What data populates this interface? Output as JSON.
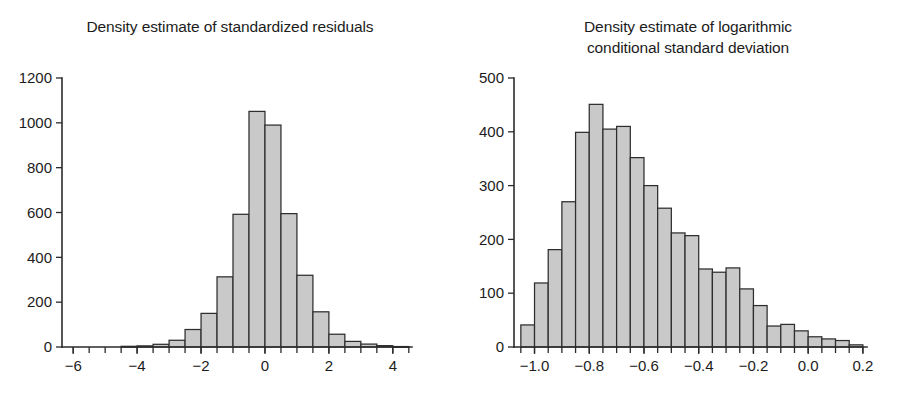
{
  "figure": {
    "background": "#ffffff",
    "bar_fill": "#c9c9c9",
    "bar_stroke": "#2e2e2e",
    "axis_color": "#2b2b2b",
    "panel_count": 2
  },
  "panels": {
    "left": {
      "title": "Density estimate of standardized residuals"
    },
    "right": {
      "title_line1": "Density estimate of logarithmic",
      "title_line2": "conditional standard deviation"
    }
  },
  "chart_data": [
    {
      "type": "bar",
      "id": "standardized-residuals-histogram",
      "title": "Density estimate of standardized residuals",
      "xlabel": "",
      "ylabel": "",
      "grid": false,
      "legend": false,
      "xlim": [
        -6.35,
        4.6
      ],
      "ylim": [
        0,
        1200
      ],
      "xticks": [
        -6,
        -4,
        -2,
        0,
        2,
        4
      ],
      "xtick_labels": [
        "−6",
        "−4",
        "−2",
        "0",
        "2",
        "4"
      ],
      "xminor_step": 0.5,
      "yticks": [
        0,
        200,
        400,
        600,
        800,
        1000,
        1200
      ],
      "ytick_labels": [
        "0",
        "200",
        "400",
        "600",
        "800",
        "1000",
        "1200"
      ],
      "bin_width": 0.5,
      "bin_edges": [
        -5.0,
        -4.5,
        -4.0,
        -3.5,
        -3.0,
        -2.5,
        -2.0,
        -1.5,
        -1.0,
        -0.5,
        0.0,
        0.5,
        1.0,
        1.5,
        2.0,
        2.5,
        3.0,
        3.5,
        4.0,
        4.5
      ],
      "bin_centers": [
        -4.75,
        -4.25,
        -3.75,
        -3.25,
        -2.75,
        -2.25,
        -1.75,
        -1.25,
        -0.75,
        -0.25,
        0.25,
        0.75,
        1.25,
        1.75,
        2.25,
        2.75,
        3.25,
        3.75,
        4.25
      ],
      "values": [
        0,
        3,
        5,
        12,
        30,
        78,
        150,
        313,
        592,
        1051,
        990,
        595,
        320,
        157,
        57,
        25,
        13,
        6,
        2
      ]
    },
    {
      "type": "bar",
      "id": "log-conditional-sd-histogram",
      "title": "Density estimate of logarithmic conditional standard deviation",
      "xlabel": "",
      "ylabel": "",
      "grid": false,
      "legend": false,
      "xlim": [
        -1.075,
        0.215
      ],
      "ylim": [
        0,
        500
      ],
      "xticks": [
        -1.0,
        -0.8,
        -0.6,
        -0.4,
        -0.2,
        0.0,
        0.2
      ],
      "xtick_labels": [
        "−1.0",
        "−0.8",
        "−0.6",
        "−0.4",
        "−0.2",
        "0.0",
        "0.2"
      ],
      "xminor_step": 0.05,
      "yticks": [
        0,
        100,
        200,
        300,
        400,
        500
      ],
      "ytick_labels": [
        "0",
        "100",
        "200",
        "300",
        "400",
        "500"
      ],
      "bin_width": 0.05,
      "bin_edges": [
        -1.05,
        -1.0,
        -0.95,
        -0.9,
        -0.85,
        -0.8,
        -0.75,
        -0.7,
        -0.65,
        -0.6,
        -0.55,
        -0.5,
        -0.45,
        -0.4,
        -0.35,
        -0.3,
        -0.25,
        -0.2,
        -0.15,
        -0.1,
        -0.05,
        0.0,
        0.05,
        0.1,
        0.15,
        0.2
      ],
      "bin_centers": [
        -1.025,
        -0.975,
        -0.925,
        -0.875,
        -0.825,
        -0.775,
        -0.725,
        -0.675,
        -0.625,
        -0.575,
        -0.525,
        -0.475,
        -0.425,
        -0.375,
        -0.325,
        -0.275,
        -0.225,
        -0.175,
        -0.125,
        -0.075,
        -0.025,
        0.025,
        0.075,
        0.125,
        0.175
      ],
      "values": [
        41,
        119,
        181,
        270,
        399,
        451,
        405,
        410,
        352,
        300,
        258,
        212,
        207,
        145,
        139,
        147,
        108,
        77,
        39,
        42,
        30,
        19,
        15,
        12,
        4
      ]
    }
  ]
}
